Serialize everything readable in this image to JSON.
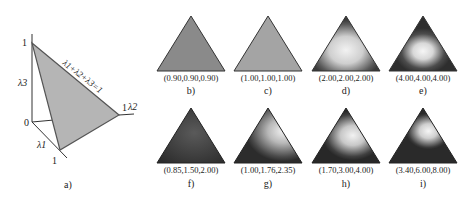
{
  "figure": {
    "panel_a": {
      "caption": "a)",
      "constraint_label": "λ1+λ2+λ3=1",
      "axis_labels": {
        "l1": "λ1",
        "l2": "λ2",
        "l3": "λ3"
      },
      "ticks": {
        "origin": "0",
        "top": "1",
        "right": "1",
        "bottom": "1"
      },
      "fill_color": "#b5b5b5"
    },
    "panels": [
      {
        "caption": "b)",
        "params": "(0.90,0.90,0.90)"
      },
      {
        "caption": "c)",
        "params": "(1.00,1.00,1.00)"
      },
      {
        "caption": "d)",
        "params": "(2.00,2.00,2.00)"
      },
      {
        "caption": "e)",
        "params": "(4.00,4.00,4.00)"
      },
      {
        "caption": "f)",
        "params": "(0.85,1.50,2.00)"
      },
      {
        "caption": "g)",
        "params": "(1.00,1.76,2.35)"
      },
      {
        "caption": "h)",
        "params": "(1.70,3.00,4.00)"
      },
      {
        "caption": "i)",
        "params": "(3.40,6.00,8.00)"
      }
    ]
  }
}
